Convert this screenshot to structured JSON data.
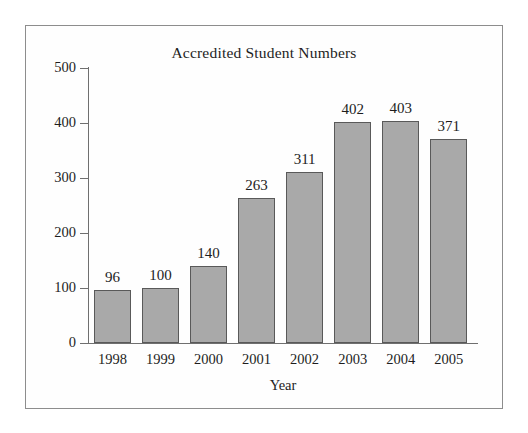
{
  "chart_data": {
    "type": "bar",
    "title": "Accredited Student Numbers",
    "xlabel": "Year",
    "ylabel": "",
    "categories": [
      "1998",
      "1999",
      "2000",
      "2001",
      "2002",
      "2003",
      "2004",
      "2005"
    ],
    "values": [
      96,
      100,
      140,
      263,
      311,
      402,
      403,
      371
    ],
    "value_labels": [
      "96",
      "100",
      "140",
      "263",
      "311",
      "402",
      "403",
      "371"
    ],
    "ylim": [
      0,
      500
    ],
    "yticks": [
      0,
      100,
      200,
      300,
      400,
      500
    ],
    "ytick_labels": [
      "0",
      "100",
      "200",
      "300",
      "400",
      "500"
    ],
    "grid": false,
    "legend": "none",
    "bar_fill_color": "#a9a9a9",
    "bar_edge_color": "#595959",
    "axis_color": "#6f6f6f",
    "frame_color": "#8d8d8d",
    "background_color": "#ffffff",
    "text_color": "#1d1d1d"
  }
}
